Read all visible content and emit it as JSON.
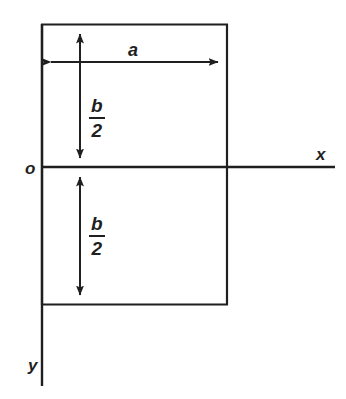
{
  "diagram": {
    "type": "engineering-dimension-diagram",
    "stroke_color": "#1f1f1f",
    "background_color": "#ffffff",
    "axes": {
      "origin_label": "o",
      "x_axis_label": "x",
      "y_axis_label": "y"
    },
    "dimensions": {
      "width_label": "a",
      "upper_half_height": {
        "numerator": "b",
        "denominator": "2"
      },
      "lower_half_height": {
        "numerator": "b",
        "denominator": "2"
      }
    },
    "geometry": {
      "rect_left": 41,
      "rect_top": 24,
      "rect_right": 228,
      "rect_bottom": 305,
      "x_axis_y": 167,
      "y_axis_x": 41,
      "x_axis_right_end": 335,
      "y_axis_bottom_end": 386,
      "dim_line_a_y": 62,
      "dim_line_b_x": 80
    }
  }
}
